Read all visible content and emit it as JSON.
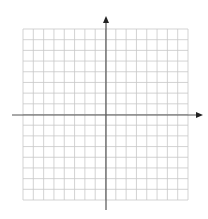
{
  "diagram": {
    "type": "coordinate-plane",
    "grid": {
      "columns": 16,
      "rows": 16,
      "left": 23,
      "top": 29,
      "right": 188,
      "bottom": 200,
      "line_color": "#c8c8c8"
    },
    "axes": {
      "color": "#555555",
      "origin_x": 106,
      "origin_y": 115,
      "x_axis": {
        "from": 12,
        "to": 203,
        "arrow": "right"
      },
      "y_axis": {
        "from": 16,
        "to": 210,
        "arrow": "up"
      }
    }
  }
}
